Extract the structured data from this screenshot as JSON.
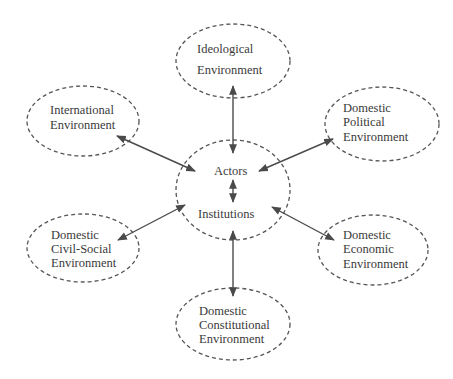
{
  "diagram": {
    "center": {
      "labels": [
        "Actors",
        "Institutions"
      ]
    },
    "nodes": [
      {
        "id": "ideological",
        "lines": [
          "Ideological",
          "Environment"
        ]
      },
      {
        "id": "international",
        "lines": [
          "International",
          "Environment"
        ]
      },
      {
        "id": "political",
        "lines": [
          "Domestic",
          "Political",
          "Environment"
        ]
      },
      {
        "id": "civil_social",
        "lines": [
          "Domestic",
          "Civil-Social",
          "Environment"
        ]
      },
      {
        "id": "economic",
        "lines": [
          "Domestic",
          "Economic",
          "Environment"
        ]
      },
      {
        "id": "constitutional",
        "lines": [
          "Domestic",
          "Constitutional",
          "Environment"
        ]
      }
    ],
    "connections": [
      {
        "from": "center",
        "to": "ideological",
        "type": "bidirectional"
      },
      {
        "from": "center",
        "to": "international",
        "type": "bidirectional"
      },
      {
        "from": "center",
        "to": "political",
        "type": "bidirectional"
      },
      {
        "from": "center",
        "to": "civil_social",
        "type": "bidirectional"
      },
      {
        "from": "center",
        "to": "economic",
        "type": "bidirectional"
      },
      {
        "from": "center",
        "to": "constitutional",
        "type": "bidirectional"
      },
      {
        "from": "actors",
        "to": "institutions",
        "type": "bidirectional"
      }
    ],
    "colors": {
      "stroke": "#555555",
      "arrow": "#4a4a4a",
      "text": "#3a3a3a",
      "background": "#ffffff"
    }
  }
}
